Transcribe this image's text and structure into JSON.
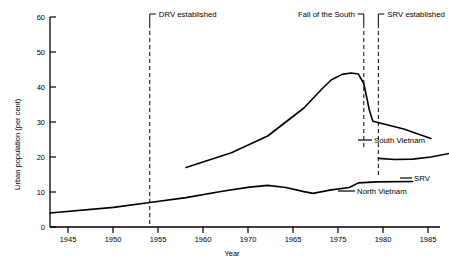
{
  "chart_data": {
    "type": "line",
    "title": "",
    "xlabel": "Year",
    "ylabel": "Urban population (per cent)",
    "xlim": [
      1943,
      1986
    ],
    "ylim": [
      0,
      60
    ],
    "grid": false,
    "legend_position": "inline-right-of-series",
    "xticks": [
      {
        "value": 1945,
        "label": "1945"
      },
      {
        "value": 1950,
        "label": "1950"
      },
      {
        "value": 1955,
        "label": "1955"
      },
      {
        "value": 1960,
        "label": "1960"
      },
      {
        "value": 1965,
        "label": "1970"
      },
      {
        "value": 1970,
        "label": "1965"
      },
      {
        "value": 1975,
        "label": "1975"
      },
      {
        "value": 1980,
        "label": "1980"
      },
      {
        "value": 1985,
        "label": "1985"
      }
    ],
    "yticks": [
      {
        "value": 0,
        "label": "0"
      },
      {
        "value": 10,
        "label": "10"
      },
      {
        "value": 20,
        "label": "20"
      },
      {
        "value": 30,
        "label": "30"
      },
      {
        "value": 40,
        "label": "40"
      },
      {
        "value": 50,
        "label": "50"
      },
      {
        "value": 60,
        "label": "60"
      }
    ],
    "series": [
      {
        "name": "North Vietnam",
        "label": "North Vietnam",
        "color": "#000000",
        "points": [
          [
            1943,
            4.0
          ],
          [
            1950,
            5.6
          ],
          [
            1954,
            7.0
          ],
          [
            1958,
            8.4
          ],
          [
            1962,
            10.2
          ],
          [
            1965,
            11.4
          ],
          [
            1967,
            11.9
          ],
          [
            1969,
            11.3
          ],
          [
            1971,
            10.1
          ],
          [
            1972,
            9.6
          ],
          [
            1974,
            10.6
          ],
          [
            1976,
            11.3
          ],
          [
            1977,
            12.6
          ],
          [
            1979,
            12.9
          ],
          [
            1983,
            13.0
          ]
        ]
      },
      {
        "name": "South Vietnam",
        "label": "South Vietnam",
        "color": "#000000",
        "points": [
          [
            1958,
            17.0
          ],
          [
            1963,
            21.2
          ],
          [
            1967,
            26.0
          ],
          [
            1971,
            34.0
          ],
          [
            1973,
            39.5
          ],
          [
            1974,
            42.0
          ],
          [
            1975.2,
            43.6
          ],
          [
            1976.2,
            44.0
          ],
          [
            1977.0,
            43.7
          ],
          [
            1977.6,
            41.0
          ],
          [
            1978.2,
            33.5
          ],
          [
            1978.6,
            30.2
          ],
          [
            1982,
            28.0
          ],
          [
            1985,
            25.3
          ]
        ]
      },
      {
        "name": "SRV",
        "label": "SRV",
        "color": "#000000",
        "points": [
          [
            1979.2,
            19.6
          ],
          [
            1981,
            19.3
          ],
          [
            1983,
            19.4
          ],
          [
            1985,
            20.0
          ],
          [
            1987,
            21.0
          ]
        ]
      }
    ],
    "annotations": [
      {
        "name": "drv-established",
        "label": "DRV established",
        "x": 1954,
        "y_top": 60
      },
      {
        "name": "fall-of-the-south",
        "label": "Fall of the South",
        "x": 1977.6,
        "y_top": 60
      },
      {
        "name": "srv-established",
        "label": "SRV established",
        "x": 1979.2,
        "y_top": 60
      }
    ]
  }
}
